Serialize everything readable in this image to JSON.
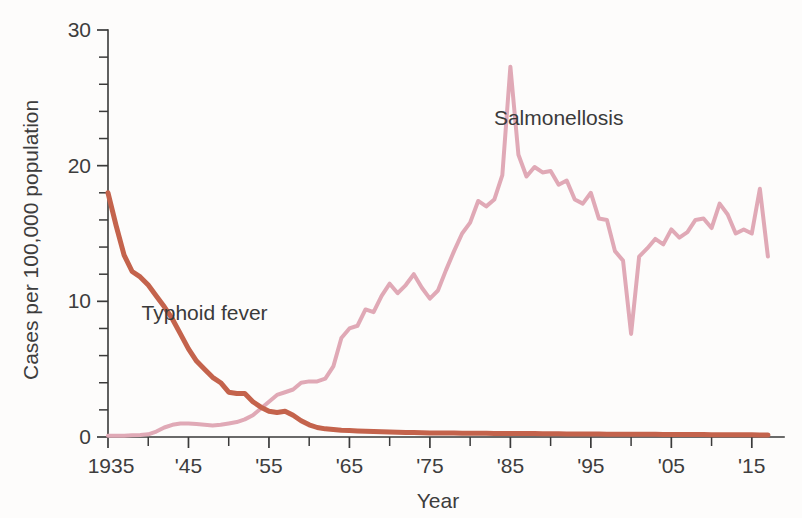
{
  "chart_data": {
    "type": "line",
    "title": "",
    "xlabel": "Year",
    "ylabel": "Cases per 100,000 population",
    "xlim": [
      1935,
      2019
    ],
    "ylim": [
      0,
      30
    ],
    "grid": false,
    "legend_position": "inline-annotations",
    "y_ticks_major": [
      0,
      10,
      20,
      30
    ],
    "y_tick_labels": [
      "0",
      "10",
      "20",
      "30"
    ],
    "y_ticks_minor": [
      2,
      4,
      6,
      8,
      12,
      14,
      16,
      18,
      22,
      24,
      26,
      28
    ],
    "x_ticks_major": [
      1935,
      1945,
      1955,
      1965,
      1975,
      1985,
      1995,
      2005,
      2015
    ],
    "x_tick_labels": [
      "1935",
      "'45",
      "'55",
      "'65",
      "'75",
      "'85",
      "'95",
      "'05",
      "'15"
    ],
    "x_ticks_minor": [
      1940,
      1950,
      1960,
      1970,
      1980,
      1990,
      2000,
      2010
    ],
    "annotations": [
      {
        "text": "Salmonellosis",
        "x": 1991,
        "y": 23.0
      },
      {
        "text": "Typhoid fever",
        "x": 1947,
        "y": 8.6
      }
    ],
    "series": [
      {
        "name": "Typhoid fever",
        "color": "#c4634c",
        "stroke_width": 5.0,
        "x": [
          1935,
          1936,
          1937,
          1938,
          1939,
          1940,
          1941,
          1942,
          1943,
          1944,
          1945,
          1946,
          1947,
          1948,
          1949,
          1950,
          1951,
          1952,
          1953,
          1954,
          1955,
          1956,
          1957,
          1958,
          1959,
          1960,
          1961,
          1962,
          1963,
          1964,
          1965,
          1966,
          1967,
          1968,
          1969,
          1970,
          1971,
          1972,
          1973,
          1974,
          1975,
          1976,
          1977,
          1978,
          1979,
          1980,
          1981,
          1982,
          1983,
          1984,
          1985,
          1986,
          1987,
          1988,
          1989,
          1990,
          1991,
          1992,
          1993,
          1994,
          1995,
          1996,
          1997,
          1998,
          1999,
          2000,
          2001,
          2002,
          2003,
          2004,
          2005,
          2006,
          2007,
          2008,
          2009,
          2010,
          2011,
          2012,
          2013,
          2014,
          2015,
          2016,
          2017
        ],
        "y": [
          18.0,
          15.6,
          13.4,
          12.2,
          11.8,
          11.2,
          10.4,
          9.6,
          8.7,
          7.6,
          6.5,
          5.6,
          5.0,
          4.4,
          4.0,
          3.3,
          3.2,
          3.2,
          2.6,
          2.2,
          1.9,
          1.8,
          1.9,
          1.6,
          1.2,
          0.9,
          0.7,
          0.6,
          0.55,
          0.5,
          0.48,
          0.45,
          0.42,
          0.4,
          0.38,
          0.36,
          0.35,
          0.34,
          0.33,
          0.32,
          0.3,
          0.3,
          0.3,
          0.3,
          0.28,
          0.28,
          0.27,
          0.27,
          0.26,
          0.26,
          0.25,
          0.25,
          0.25,
          0.25,
          0.24,
          0.24,
          0.24,
          0.23,
          0.23,
          0.22,
          0.22,
          0.22,
          0.21,
          0.21,
          0.2,
          0.2,
          0.2,
          0.2,
          0.2,
          0.19,
          0.19,
          0.19,
          0.18,
          0.18,
          0.18,
          0.17,
          0.17,
          0.17,
          0.16,
          0.16,
          0.16,
          0.15,
          0.15
        ]
      },
      {
        "name": "Salmonellosis",
        "color": "#e0a9b6",
        "stroke_width": 4.0,
        "x": [
          1935,
          1936,
          1937,
          1938,
          1939,
          1940,
          1941,
          1942,
          1943,
          1944,
          1945,
          1946,
          1947,
          1948,
          1949,
          1950,
          1951,
          1952,
          1953,
          1954,
          1955,
          1956,
          1957,
          1958,
          1959,
          1960,
          1961,
          1962,
          1963,
          1964,
          1965,
          1966,
          1967,
          1968,
          1969,
          1970,
          1971,
          1972,
          1973,
          1974,
          1975,
          1976,
          1977,
          1978,
          1979,
          1980,
          1981,
          1982,
          1983,
          1984,
          1985,
          1986,
          1987,
          1988,
          1989,
          1990,
          1991,
          1992,
          1993,
          1994,
          1995,
          1996,
          1997,
          1998,
          1999,
          2000,
          2001,
          2002,
          2003,
          2004,
          2005,
          2006,
          2007,
          2008,
          2009,
          2010,
          2011,
          2012,
          2013,
          2014,
          2015,
          2016,
          2017
        ],
        "y": [
          0.1,
          0.1,
          0.1,
          0.12,
          0.15,
          0.2,
          0.4,
          0.7,
          0.9,
          1.0,
          1.0,
          0.95,
          0.9,
          0.85,
          0.9,
          1.0,
          1.1,
          1.3,
          1.6,
          2.1,
          2.6,
          3.1,
          3.3,
          3.5,
          4.0,
          4.1,
          4.1,
          4.3,
          5.2,
          7.3,
          8.0,
          8.2,
          9.4,
          9.2,
          10.4,
          11.3,
          10.6,
          11.2,
          12.0,
          11.0,
          10.2,
          10.8,
          12.3,
          13.7,
          15.0,
          15.8,
          17.4,
          17.0,
          17.5,
          19.3,
          27.3,
          20.8,
          19.2,
          19.9,
          19.5,
          19.6,
          18.6,
          18.9,
          17.5,
          17.2,
          18.0,
          16.1,
          16.0,
          13.7,
          13.0,
          7.6,
          13.3,
          13.9,
          14.6,
          14.2,
          15.3,
          14.7,
          15.1,
          16.0,
          16.1,
          15.4,
          17.2,
          16.4,
          15.0,
          15.3,
          15.0,
          18.3,
          13.3
        ]
      }
    ]
  },
  "axis": {
    "ylabel": "Cases per 100,000 population",
    "xlabel": "Year"
  },
  "labels": {
    "salmonellosis": "Salmonellosis",
    "typhoid": "Typhoid fever"
  }
}
